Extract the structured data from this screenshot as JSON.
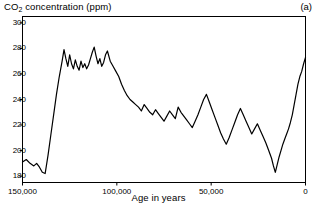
{
  "panel_label": "(a)",
  "chart_data": {
    "type": "line",
    "title": "",
    "ylabel": "CO2 concentration (ppm)",
    "ylabel_parts": {
      "pre": "CO",
      "sub": "2",
      "post": " concentration (ppm)"
    },
    "xlabel": "Age in years",
    "xlim": [
      150000,
      0
    ],
    "ylim": [
      175,
      305
    ],
    "x_inverted": true,
    "grid": false,
    "legend": "none",
    "yticks": [
      300,
      280,
      260,
      240,
      220,
      200,
      180
    ],
    "ytick_labels": [
      "300",
      "280",
      "260",
      "240",
      "220",
      "200",
      "180"
    ],
    "xticks": [
      150000,
      100000,
      50000,
      0
    ],
    "xtick_labels": [
      "150,000",
      "100,000",
      "50,000",
      "0"
    ],
    "line_color": "#000000",
    "line_width": 1.2,
    "series": [
      {
        "name": "CO2 concentration",
        "x": [
          150000,
          148000,
          146000,
          144000,
          142500,
          141000,
          139500,
          138000,
          136500,
          135000,
          133500,
          132000,
          130500,
          129000,
          128000,
          127000,
          126000,
          125000,
          124000,
          123000,
          122000,
          121000,
          120000,
          119000,
          118000,
          117000,
          116000,
          115000,
          114000,
          113000,
          112000,
          111000,
          110000,
          109000,
          108000,
          107000,
          106000,
          105000,
          103500,
          102000,
          100500,
          99000,
          97500,
          96000,
          94500,
          93000,
          91500,
          90000,
          88500,
          87000,
          85500,
          84000,
          82500,
          81000,
          79500,
          78000,
          76500,
          75000,
          73500,
          72000,
          70500,
          69000,
          67500,
          66000,
          64500,
          63000,
          61500,
          60000,
          58500,
          57000,
          55500,
          54000,
          52500,
          51000,
          49500,
          48000,
          46500,
          45000,
          43500,
          42000,
          40500,
          39000,
          37500,
          36000,
          34500,
          33000,
          31500,
          30000,
          28500,
          27000,
          25500,
          24000,
          22500,
          21000,
          19500,
          18000,
          17000,
          16000,
          15000,
          14000,
          13000,
          12000,
          11000,
          10000,
          9000,
          8000,
          7000,
          6000,
          5000,
          4000,
          3000,
          2000,
          1000,
          0
        ],
        "y": [
          191,
          193,
          190,
          188,
          190,
          187,
          183,
          182,
          196,
          212,
          228,
          244,
          258,
          270,
          279,
          272,
          266,
          275,
          268,
          264,
          271,
          266,
          263,
          270,
          265,
          268,
          264,
          267,
          272,
          277,
          281,
          274,
          268,
          272,
          266,
          269,
          275,
          278,
          270,
          266,
          262,
          258,
          252,
          247,
          243,
          240,
          238,
          236,
          234,
          231,
          236,
          233,
          230,
          228,
          232,
          229,
          226,
          223,
          227,
          231,
          228,
          225,
          234,
          230,
          227,
          224,
          221,
          218,
          223,
          228,
          234,
          240,
          244,
          238,
          232,
          226,
          220,
          214,
          209,
          205,
          210,
          216,
          222,
          228,
          233,
          228,
          223,
          218,
          213,
          217,
          221,
          216,
          211,
          206,
          200,
          194,
          188,
          183,
          189,
          195,
          200,
          205,
          209,
          213,
          217,
          222,
          228,
          236,
          244,
          252,
          258,
          262,
          268,
          273
        ]
      }
    ]
  }
}
